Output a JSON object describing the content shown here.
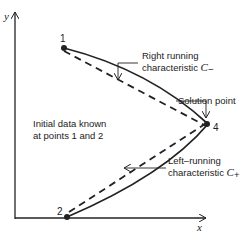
{
  "axes": {
    "x_label": "x",
    "y_label": "y"
  },
  "points": [
    {
      "id": "1",
      "label": "1"
    },
    {
      "id": "2",
      "label": "2"
    },
    {
      "id": "4",
      "label": "4"
    }
  ],
  "annotations": {
    "right_running_line1": "Right running",
    "right_running_line2": "characteristic",
    "right_running_symbol": "C",
    "right_running_sub": "−",
    "solution_point": "Solution point",
    "initial_data_line1": "Initial data known",
    "initial_data_line2": "at points 1 and 2",
    "left_running_line1": "Left–running",
    "left_running_line2": "characteristic",
    "left_running_symbol": "C",
    "left_running_sub": "+"
  },
  "colors": {
    "ink": "#222222",
    "background": "#ffffff"
  }
}
